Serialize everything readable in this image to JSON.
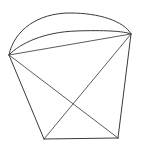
{
  "page": {
    "background_color": "#ffffff",
    "width": 141,
    "height": 147
  },
  "artifact": {
    "top_text": "",
    "color": "#dcdcdc"
  },
  "figure": {
    "name": "cone-with-elliptical-base-sketch",
    "stroke_color": "#3a3a3a",
    "stroke_width": 1,
    "style": "hand-drawn",
    "vertices": {
      "left": {
        "label": "A",
        "x": 9,
        "y": 55
      },
      "right": {
        "label": "B",
        "x": 131,
        "y": 34
      },
      "bottom_left": {
        "label": "C",
        "x": 44,
        "y": 139
      },
      "bottom_right": {
        "label": "D",
        "x": 118,
        "y": 138
      },
      "diagonal_crossing": {
        "label": "X",
        "x": 72,
        "y": 103
      }
    },
    "paths": [
      {
        "name": "upper-arc",
        "type": "arc",
        "from": [
          9,
          55
        ],
        "to": [
          131,
          34
        ],
        "apex": [
          68,
          13
        ],
        "d": "M 9 55 C 14 30, 38 13, 70 13 C 99 13, 124 21, 131 34"
      },
      {
        "name": "lower-arc",
        "type": "arc",
        "from": [
          9,
          55
        ],
        "to": [
          131,
          34
        ],
        "apex": [
          72,
          31
        ],
        "d": "M 9 55 C 20 43, 45 32, 76 31 C 103 30, 124 31, 131 34"
      },
      {
        "name": "rim-chord",
        "type": "line",
        "from": [
          9,
          55
        ],
        "to": [
          131,
          34
        ],
        "d": "M 9 55 L 131 34"
      },
      {
        "name": "left-side-edge",
        "type": "line",
        "from": [
          9,
          55
        ],
        "to": [
          44,
          139
        ],
        "d": "M 9 55 L 44 139"
      },
      {
        "name": "right-side-edge",
        "type": "line",
        "from": [
          131,
          34
        ],
        "to": [
          118,
          138
        ],
        "d": "M 131 34 L 118 138"
      },
      {
        "name": "bottom-edge",
        "type": "line",
        "from": [
          44,
          139
        ],
        "to": [
          118,
          138
        ],
        "d": "M 44 139 L 118 138"
      },
      {
        "name": "diagonal-left-to-bottom-right",
        "type": "line",
        "from": [
          9,
          55
        ],
        "to": [
          118,
          138
        ],
        "d": "M 9 55 L 118 138"
      },
      {
        "name": "diagonal-right-to-bottom-left",
        "type": "line",
        "from": [
          131,
          34
        ],
        "to": [
          44,
          139
        ],
        "d": "M 131 34 L 44 139"
      }
    ]
  }
}
